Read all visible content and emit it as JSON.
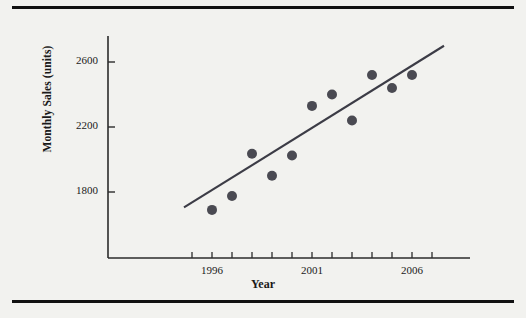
{
  "figure": {
    "background_color": "#f2f2ef",
    "rule_color": "#111111",
    "has_top_rule": true,
    "has_bottom_rule": true
  },
  "chart_data": {
    "type": "scatter",
    "title": "",
    "xlabel": "Year",
    "ylabel": "Monthly Sales (units)",
    "xlim": [
      1993.5,
      2008.5
    ],
    "ylim": [
      1450,
      2800
    ],
    "grid": false,
    "legend": null,
    "xticks": [
      1996,
      2001,
      2006
    ],
    "xtick_labels": [
      "1996",
      "2001",
      "2006"
    ],
    "minor_xticks": [
      1995,
      1997,
      1998,
      1999,
      2000,
      2002,
      2003,
      2004,
      2005,
      2007
    ],
    "yticks": [
      1800,
      2200,
      2600
    ],
    "ytick_labels": [
      "1800",
      "2200",
      "2600"
    ],
    "marker_color": "#4a4a52",
    "marker_size": 5,
    "x": [
      1996,
      1997,
      1998,
      1999,
      2000,
      2001,
      2002,
      2003,
      2004,
      2005,
      2006
    ],
    "y": [
      1690,
      1775,
      2035,
      1900,
      2025,
      2330,
      2400,
      2240,
      2520,
      2440,
      2520
    ],
    "points": [
      {
        "x": 1996,
        "y": 1690
      },
      {
        "x": 1997,
        "y": 1775
      },
      {
        "x": 1998,
        "y": 2035
      },
      {
        "x": 1999,
        "y": 1900
      },
      {
        "x": 2000,
        "y": 2025
      },
      {
        "x": 2001,
        "y": 2330
      },
      {
        "x": 2002,
        "y": 2400
      },
      {
        "x": 2003,
        "y": 2240
      },
      {
        "x": 2004,
        "y": 2520
      },
      {
        "x": 2005,
        "y": 2440
      },
      {
        "x": 2006,
        "y": 2520
      }
    ],
    "trendline": {
      "type": "linear",
      "color": "#3c3c46",
      "x_start": 1994.6,
      "y_start": 1705,
      "x_end": 2007.6,
      "y_end": 2700
    }
  }
}
